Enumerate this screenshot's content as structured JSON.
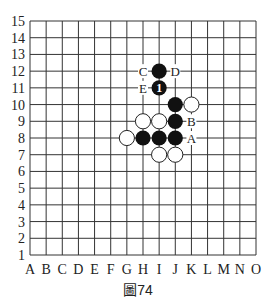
{
  "figure": {
    "caption": "圖74",
    "columns": [
      "A",
      "B",
      "C",
      "D",
      "E",
      "F",
      "G",
      "H",
      "I",
      "J",
      "K",
      "L",
      "M",
      "N",
      "O"
    ],
    "rows": [
      "1",
      "2",
      "3",
      "4",
      "5",
      "6",
      "7",
      "8",
      "9",
      "10",
      "11",
      "12",
      "13",
      "14",
      "15"
    ],
    "grid": {
      "left": 30,
      "top": 21,
      "right": 256,
      "bottom": 255
    }
  },
  "stones": {
    "black": [
      {
        "pos": "I12"
      },
      {
        "pos": "I11",
        "label": "1"
      },
      {
        "pos": "J10"
      },
      {
        "pos": "J9"
      },
      {
        "pos": "J8"
      },
      {
        "pos": "I8"
      },
      {
        "pos": "H8"
      }
    ],
    "white": [
      {
        "pos": "K10"
      },
      {
        "pos": "H9"
      },
      {
        "pos": "I9"
      },
      {
        "pos": "G8"
      },
      {
        "pos": "I7"
      },
      {
        "pos": "J7"
      }
    ]
  },
  "markers": [
    {
      "pos": "H12",
      "label": "C"
    },
    {
      "pos": "J12",
      "label": "D"
    },
    {
      "pos": "H11",
      "label": "E"
    },
    {
      "pos": "K9",
      "label": "B"
    },
    {
      "pos": "K8",
      "label": "A"
    }
  ]
}
